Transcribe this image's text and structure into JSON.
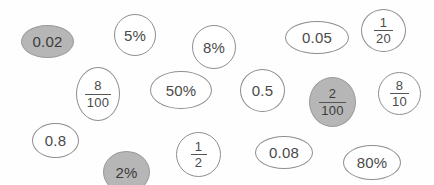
{
  "canvas": {
    "width": 434,
    "height": 185,
    "background": "#fefefe"
  },
  "style": {
    "outline_color": "#8e8e8e",
    "text_color": "#4a4a4a",
    "fill_highlight": "#b6b6b6",
    "fill_default": "#ffffff"
  },
  "bubbles": [
    {
      "id": "bubble-0-02",
      "name": "bubble-0-02",
      "kind": "decimal",
      "text": "0.02",
      "highlighted": true,
      "x": 21,
      "y": 25,
      "w": 53,
      "h": 33,
      "font_size": 15
    },
    {
      "id": "bubble-5-percent",
      "name": "bubble-5-percent",
      "kind": "percent",
      "text": "5%",
      "highlighted": false,
      "x": 114,
      "y": 14,
      "w": 42,
      "h": 42,
      "font_size": 15
    },
    {
      "id": "bubble-8-percent",
      "name": "bubble-8-percent",
      "kind": "percent",
      "text": "8%",
      "highlighted": false,
      "x": 192,
      "y": 25,
      "w": 44,
      "h": 44,
      "font_size": 15
    },
    {
      "id": "bubble-0-05",
      "name": "bubble-0-05",
      "kind": "decimal",
      "text": "0.05",
      "highlighted": false,
      "x": 285,
      "y": 21,
      "w": 64,
      "h": 33,
      "font_size": 15
    },
    {
      "id": "bubble-1-over-20",
      "name": "bubble-1-over-20",
      "kind": "fraction",
      "numerator": "1",
      "denominator": "20",
      "highlighted": false,
      "x": 361,
      "y": 9,
      "w": 45,
      "h": 43,
      "font_size": 13
    },
    {
      "id": "bubble-8-over-100",
      "name": "bubble-8-over-100",
      "kind": "fraction",
      "numerator": "8",
      "denominator": "100",
      "highlighted": false,
      "x": 76,
      "y": 67,
      "w": 44,
      "h": 54,
      "font_size": 13
    },
    {
      "id": "bubble-50-percent",
      "name": "bubble-50-percent",
      "kind": "percent",
      "text": "50%",
      "highlighted": false,
      "x": 150,
      "y": 71,
      "w": 62,
      "h": 38,
      "font_size": 15
    },
    {
      "id": "bubble-0-5",
      "name": "bubble-0-5",
      "kind": "decimal",
      "text": "0.5",
      "highlighted": false,
      "x": 240,
      "y": 69,
      "w": 45,
      "h": 43,
      "font_size": 15
    },
    {
      "id": "bubble-2-over-100",
      "name": "bubble-2-over-100",
      "kind": "fraction",
      "numerator": "2",
      "denominator": "100",
      "highlighted": true,
      "x": 309,
      "y": 77,
      "w": 47,
      "h": 50,
      "font_size": 13
    },
    {
      "id": "bubble-8-over-10",
      "name": "bubble-8-over-10",
      "kind": "fraction",
      "numerator": "8",
      "denominator": "10",
      "highlighted": false,
      "x": 378,
      "y": 72,
      "w": 43,
      "h": 43,
      "font_size": 13
    },
    {
      "id": "bubble-0-8",
      "name": "bubble-0-8",
      "kind": "decimal",
      "text": "0.8",
      "highlighted": false,
      "x": 32,
      "y": 123,
      "w": 47,
      "h": 35,
      "font_size": 15
    },
    {
      "id": "bubble-2-percent",
      "name": "bubble-2-percent",
      "kind": "percent",
      "text": "2%",
      "highlighted": true,
      "x": 103,
      "y": 151,
      "w": 47,
      "h": 42,
      "font_size": 15
    },
    {
      "id": "bubble-1-over-2",
      "name": "bubble-1-over-2",
      "kind": "fraction",
      "numerator": "1",
      "denominator": "2",
      "highlighted": false,
      "x": 176,
      "y": 132,
      "w": 45,
      "h": 45,
      "font_size": 13
    },
    {
      "id": "bubble-0-08",
      "name": "bubble-0-08",
      "kind": "decimal",
      "text": "0.08",
      "highlighted": false,
      "x": 255,
      "y": 136,
      "w": 58,
      "h": 33,
      "font_size": 15
    },
    {
      "id": "bubble-80-percent",
      "name": "bubble-80-percent",
      "kind": "percent",
      "text": "80%",
      "highlighted": false,
      "x": 343,
      "y": 145,
      "w": 58,
      "h": 35,
      "font_size": 15
    }
  ]
}
